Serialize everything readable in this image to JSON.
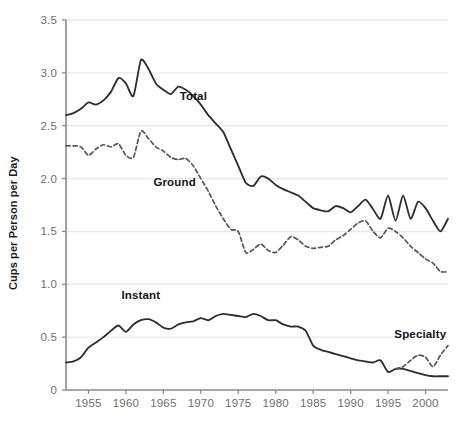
{
  "chart_data": {
    "type": "line",
    "title": "",
    "subtitle": "",
    "xlabel": "",
    "ylabel": "Cups per Person per Day",
    "xlim": [
      1952,
      2003
    ],
    "ylim": [
      0,
      3.5
    ],
    "grid": true,
    "grid_axis": "y",
    "legend_position": "inline-annotations",
    "x_ticks": [
      1955,
      1960,
      1965,
      1970,
      1975,
      1980,
      1985,
      1990,
      1995,
      2000
    ],
    "x_tick_labels": [
      "1955",
      "1960",
      "1965",
      "1970",
      "1975",
      "1980",
      "1985",
      "1990",
      "1995",
      "2000"
    ],
    "y_ticks": [
      0,
      0.5,
      1.0,
      1.5,
      2.0,
      2.5,
      3.0,
      3.5
    ],
    "y_tick_labels": [
      "0",
      "0.5",
      "1.0",
      "1.5",
      "2.0",
      "2.5",
      "3.0",
      "3.5"
    ],
    "series": [
      {
        "name": "Total",
        "style": "solid",
        "color": "#2e2e2e",
        "label_x": 1969.0,
        "label_y": 2.74,
        "x": [
          1952,
          1953,
          1954,
          1955,
          1956,
          1957,
          1958,
          1959,
          1960,
          1961,
          1962,
          1963,
          1964,
          1965,
          1966,
          1967,
          1968,
          1969,
          1970,
          1971,
          1972,
          1973,
          1974,
          1975,
          1976,
          1977,
          1978,
          1979,
          1980,
          1981,
          1982,
          1983,
          1984,
          1985,
          1986,
          1987,
          1988,
          1989,
          1990,
          1991,
          1992,
          1993,
          1994,
          1995,
          1996,
          1997,
          1998,
          1999,
          2000,
          2001,
          2002,
          2003
        ],
        "values": [
          2.6,
          2.62,
          2.66,
          2.72,
          2.7,
          2.74,
          2.82,
          2.95,
          2.9,
          2.78,
          3.12,
          3.04,
          2.9,
          2.84,
          2.8,
          2.87,
          2.84,
          2.78,
          2.7,
          2.6,
          2.52,
          2.44,
          2.28,
          2.12,
          1.96,
          1.93,
          2.02,
          2.0,
          1.94,
          1.9,
          1.87,
          1.84,
          1.78,
          1.72,
          1.7,
          1.69,
          1.74,
          1.72,
          1.68,
          1.74,
          1.8,
          1.71,
          1.62,
          1.84,
          1.6,
          1.84,
          1.62,
          1.78,
          1.72,
          1.6,
          1.5,
          1.62
        ]
      },
      {
        "name": "Ground",
        "style": "dashed",
        "color": "#55555b",
        "label_x": 1966.5,
        "label_y": 1.93,
        "x": [
          1952,
          1953,
          1954,
          1955,
          1956,
          1957,
          1958,
          1959,
          1960,
          1961,
          1962,
          1963,
          1964,
          1965,
          1966,
          1967,
          1968,
          1969,
          1970,
          1971,
          1972,
          1973,
          1974,
          1975,
          1976,
          1977,
          1978,
          1979,
          1980,
          1981,
          1982,
          1983,
          1984,
          1985,
          1986,
          1987,
          1988,
          1989,
          1990,
          1991,
          1992,
          1993,
          1994,
          1995,
          1996,
          1997,
          1998,
          1999,
          2000,
          2001,
          2002,
          2003
        ],
        "values": [
          2.31,
          2.31,
          2.3,
          2.22,
          2.28,
          2.32,
          2.3,
          2.33,
          2.22,
          2.2,
          2.45,
          2.38,
          2.3,
          2.26,
          2.2,
          2.18,
          2.19,
          2.12,
          2.0,
          1.88,
          1.74,
          1.62,
          1.52,
          1.5,
          1.3,
          1.33,
          1.38,
          1.32,
          1.3,
          1.37,
          1.45,
          1.42,
          1.36,
          1.34,
          1.35,
          1.36,
          1.42,
          1.46,
          1.52,
          1.58,
          1.6,
          1.5,
          1.44,
          1.53,
          1.5,
          1.44,
          1.36,
          1.3,
          1.24,
          1.2,
          1.12,
          1.12
        ]
      },
      {
        "name": "Instant",
        "style": "solid",
        "color": "#2e2e2e",
        "label_x": 1962.0,
        "label_y": 0.86,
        "x": [
          1952,
          1953,
          1954,
          1955,
          1956,
          1957,
          1958,
          1959,
          1960,
          1961,
          1962,
          1963,
          1964,
          1965,
          1966,
          1967,
          1968,
          1969,
          1970,
          1971,
          1972,
          1973,
          1974,
          1975,
          1976,
          1977,
          1978,
          1979,
          1980,
          1981,
          1982,
          1983,
          1984,
          1985,
          1986,
          1987,
          1988,
          1989,
          1990,
          1991,
          1992,
          1993,
          1994,
          1995,
          1996,
          1997,
          1998,
          1999,
          2000,
          2001,
          2002,
          2003
        ],
        "values": [
          0.26,
          0.27,
          0.31,
          0.4,
          0.45,
          0.5,
          0.56,
          0.61,
          0.55,
          0.62,
          0.66,
          0.67,
          0.64,
          0.59,
          0.58,
          0.62,
          0.64,
          0.65,
          0.68,
          0.66,
          0.7,
          0.72,
          0.71,
          0.7,
          0.69,
          0.72,
          0.7,
          0.66,
          0.66,
          0.62,
          0.6,
          0.6,
          0.56,
          0.42,
          0.38,
          0.36,
          0.34,
          0.32,
          0.3,
          0.28,
          0.27,
          0.26,
          0.28,
          0.17,
          0.2,
          0.2,
          0.18,
          0.16,
          0.14,
          0.13,
          0.13,
          0.13
        ]
      },
      {
        "name": "Specialty",
        "style": "dashed",
        "color": "#55555b",
        "label_x": 1999.3,
        "label_y": 0.49,
        "x": [
          1996,
          1997,
          1998,
          1999,
          2000,
          2001,
          2002,
          2003
        ],
        "values": [
          0.2,
          0.22,
          0.28,
          0.33,
          0.31,
          0.22,
          0.33,
          0.42
        ]
      }
    ]
  }
}
